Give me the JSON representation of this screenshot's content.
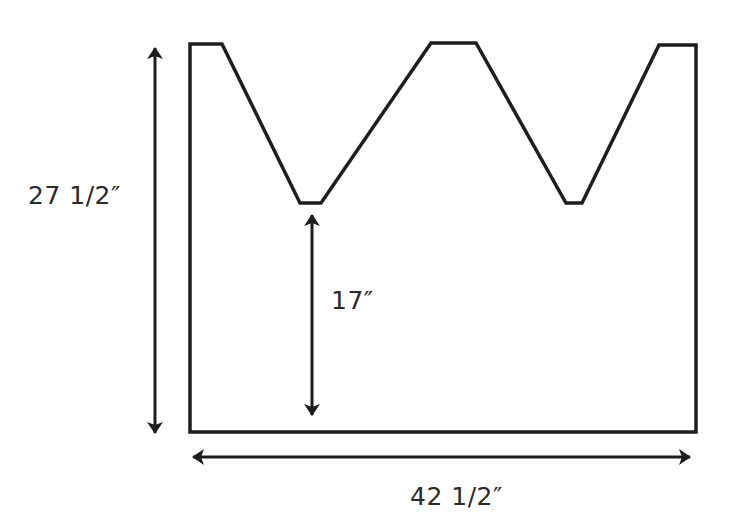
{
  "diagram": {
    "type": "pattern-schematic",
    "stroke_color": "#1e1e1e",
    "text_color": "#2a2a2a",
    "background": "#ffffff",
    "dimensions": {
      "height": {
        "label": "27 1/2″",
        "orientation": "vertical",
        "spans": "full panel height"
      },
      "valley_height": {
        "label": "17″",
        "orientation": "vertical",
        "spans": "bottom edge to bottom of notch"
      },
      "width": {
        "label": "42 1/2″",
        "orientation": "horizontal",
        "spans": "full panel width"
      }
    },
    "outline_points": [
      [
        190,
        44
      ],
      [
        222,
        44
      ],
      [
        300,
        203
      ],
      [
        321,
        203
      ],
      [
        431,
        43
      ],
      [
        476,
        43
      ],
      [
        566,
        203
      ],
      [
        582,
        203
      ],
      [
        659,
        45
      ],
      [
        696,
        45
      ],
      [
        696,
        432
      ],
      [
        190,
        432
      ]
    ],
    "arrows": [
      {
        "name": "height-arrow",
        "x1": 155,
        "y1": 48,
        "x2": 155,
        "y2": 433
      },
      {
        "name": "valley-arrow",
        "x1": 312,
        "y1": 215,
        "x2": 312,
        "y2": 415
      },
      {
        "name": "width-arrow",
        "x1": 193,
        "y1": 457,
        "x2": 690,
        "y2": 457
      }
    ]
  }
}
